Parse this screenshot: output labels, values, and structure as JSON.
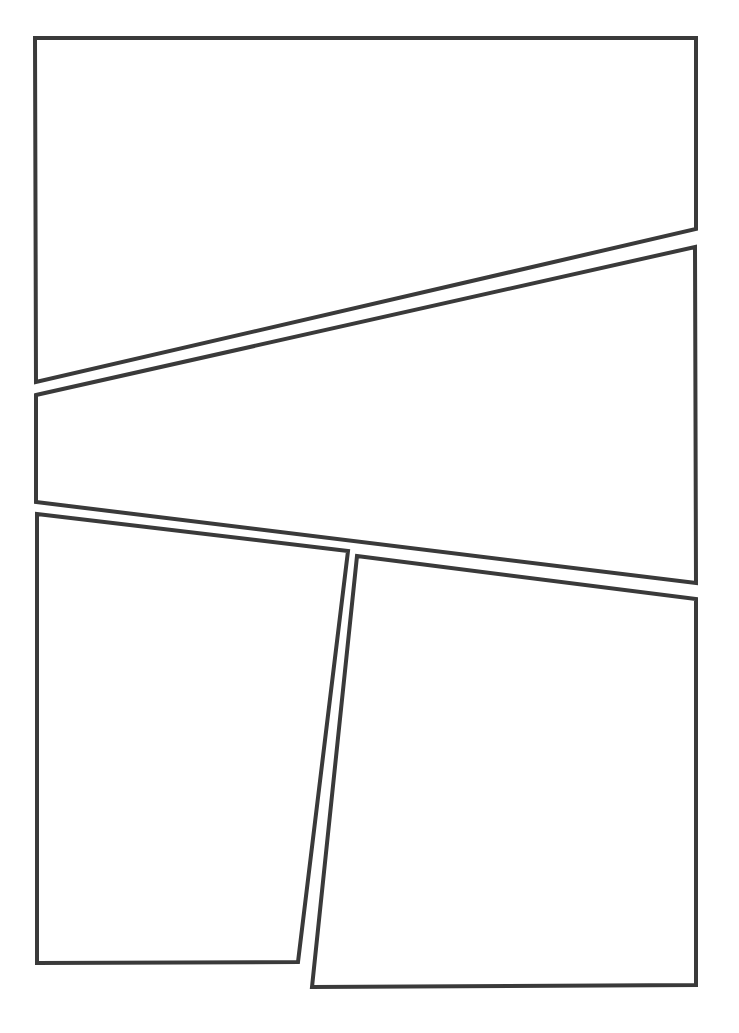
{
  "page": {
    "width": 739,
    "height": 1033,
    "background": "#ffffff"
  },
  "style": {
    "stroke_color": "#3a3a3a",
    "stroke_width": 4
  },
  "panels": [
    {
      "id": "panel-1",
      "points": [
        [
          35,
          38
        ],
        [
          696,
          38
        ],
        [
          696,
          229
        ],
        [
          36,
          382
        ]
      ]
    },
    {
      "id": "panel-2",
      "points": [
        [
          36,
          395
        ],
        [
          695,
          247
        ],
        [
          696,
          583
        ],
        [
          36,
          502
        ]
      ]
    },
    {
      "id": "panel-3",
      "points": [
        [
          37,
          514
        ],
        [
          348,
          551
        ],
        [
          298,
          962
        ],
        [
          37,
          963
        ]
      ]
    },
    {
      "id": "panel-4",
      "points": [
        [
          357,
          556
        ],
        [
          696,
          599
        ],
        [
          696,
          985
        ],
        [
          312,
          987
        ]
      ]
    }
  ]
}
